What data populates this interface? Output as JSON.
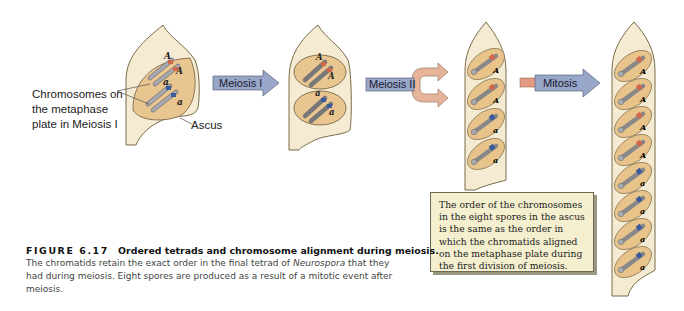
{
  "figure": {
    "labels": {
      "chromosomes_callout": [
        "Chromosomes on",
        "the metaphase",
        "plate in Meiosis I"
      ],
      "ascus": "Ascus"
    },
    "arrows": [
      {
        "label": "Meiosis I",
        "color": "#98a6c8"
      },
      {
        "label": "Meiosis II",
        "color": "#98a6c8",
        "fork_color": "#e6b49a"
      },
      {
        "label": "Mitosis",
        "color": "#98a6c8",
        "tail_color": "#e49a80"
      }
    ],
    "alleles": {
      "dominant": "A",
      "recessive": "a",
      "dominant_color": "#d0664a",
      "recessive_color": "#3a5a9c"
    },
    "stages": [
      {
        "name": "metaphase-I",
        "spores": []
      },
      {
        "name": "after-meiosis-I",
        "nuclei": [
          "A",
          "a"
        ]
      },
      {
        "name": "after-meiosis-II",
        "spores": [
          "A",
          "A",
          "a",
          "a"
        ]
      },
      {
        "name": "after-mitosis",
        "spores": [
          "A",
          "A",
          "A",
          "A",
          "a",
          "a",
          "a",
          "a"
        ]
      }
    ],
    "note": "The order of the chromosomes in the eight spores in the ascus is the same as the order in which the chromatids aligned on the metaphase plate during the first division of meiosis."
  },
  "caption": {
    "figure_number": "FIGURE 6.17",
    "title": "Ordered tetrads and chromosome alignment during meiosis.",
    "body_before_italic": "The chromatids retain the exact order in the final tetrad of ",
    "italic": "Neurospora",
    "body_after_italic": " that they had during meiosis. Eight spores are produced as a result of a mitotic event after meiosis."
  }
}
